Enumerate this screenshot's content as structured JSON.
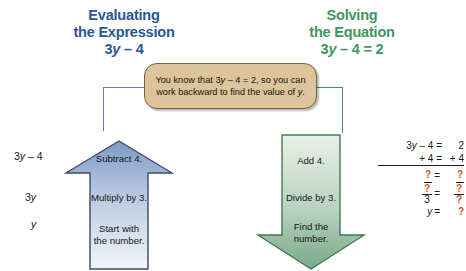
{
  "colors": {
    "blue_heading": "#2a5696",
    "green_heading": "#3f9460",
    "callout_fill": "#dcc49b",
    "callout_border": "#7a6038",
    "blue_arrow_top": "#7e9ac6",
    "blue_arrow_bottom": "#eef1f7",
    "blue_arrow_border": "#3c4a63",
    "green_arrow_top": "#e6eee6",
    "green_arrow_bottom": "#7aa98a",
    "green_arrow_border": "#3f7a56",
    "question_orange": "#d4500f"
  },
  "headings": {
    "left": {
      "line1": "Evaluating",
      "line2": "the Expression",
      "line3_prefix": "3",
      "line3_var": "y",
      "line3_suffix": " – 4"
    },
    "right": {
      "line1": "Solving",
      "line2": "the Equation",
      "line3_prefix": "3",
      "line3_var": "y",
      "line3_suffix": " – 4 = 2"
    }
  },
  "callout": {
    "part1": "You know that 3",
    "var1": "y",
    "part2": " – 4 = 2, so you can work backward to find the value of ",
    "var2": "y",
    "part3": "."
  },
  "left_column": {
    "value_top_prefix": "3",
    "value_top_var": "y",
    "value_top_suffix": " – 4",
    "value_mid_prefix": "3",
    "value_mid_var": "y",
    "value_bottom_var": "y"
  },
  "up_arrow": {
    "direction": "up",
    "step_top": "Subtract 4.",
    "step_mid": "Multiply by 3.",
    "step_bottom_line1": "Start with",
    "step_bottom_line2": "the number."
  },
  "down_arrow": {
    "direction": "down",
    "step_top": "Add 4.",
    "step_mid": "Divide by 3.",
    "step_bottom_line1": "Find the",
    "step_bottom_line2": "number."
  },
  "equation_work": {
    "row1": {
      "lhs_prefix": "3",
      "lhs_var": "y",
      "lhs_suffix": " – 4 =",
      "rhs": "2"
    },
    "row2": {
      "lhs": "+ 4 =",
      "rhs": "+ 4"
    },
    "row3": {
      "lhs": "?",
      "eq": "=",
      "rhs": "?"
    },
    "row4": {
      "num": "?",
      "den": "3",
      "eq": "=",
      "rhs_num": "?",
      "rhs_den": "?"
    },
    "row5": {
      "lhs_var": "y",
      "eq": "=",
      "rhs": "?"
    }
  }
}
